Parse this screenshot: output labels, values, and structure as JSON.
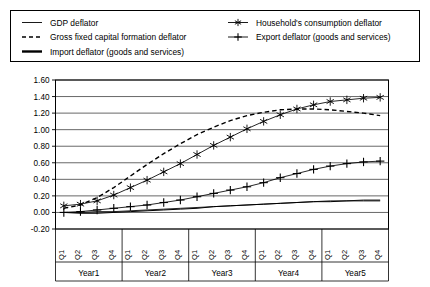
{
  "legend": {
    "position": "top",
    "items": [
      {
        "label": "GDP deflator",
        "marker": "line-thin",
        "key": "gdp"
      },
      {
        "label": "Household's consumption deflator",
        "marker": "line-star",
        "key": "household"
      },
      {
        "label": "Gross fixed capital formation deflator",
        "marker": "line-dashed",
        "key": "gfcf"
      },
      {
        "label": "Export deflator (goods and services)",
        "marker": "line-plus",
        "key": "export"
      },
      {
        "label": "Import deflator (goods and services)",
        "marker": "line-thick",
        "key": "import"
      }
    ]
  },
  "chart_data": {
    "type": "line",
    "title": "",
    "xlabel": "",
    "ylabel": "",
    "ylim": [
      -0.2,
      1.6
    ],
    "ytick_step": 0.2,
    "grid": true,
    "ytick_labels": [
      "1.60",
      "1.40",
      "1.20",
      "1.00",
      "0.80",
      "0.60",
      "0.40",
      "0.20",
      "0.00",
      "-0.20"
    ],
    "ytick_values": [
      1.6,
      1.4,
      1.2,
      1.0,
      0.8,
      0.6,
      0.4,
      0.2,
      0.0,
      -0.2
    ],
    "x": [
      "Q1",
      "Q2",
      "Q3",
      "Q4",
      "Q1",
      "Q2",
      "Q3",
      "Q4",
      "Q1",
      "Q2",
      "Q3",
      "Q4",
      "Q1",
      "Q2",
      "Q3",
      "Q4",
      "Q1",
      "Q2",
      "Q3",
      "Q4"
    ],
    "x_groups": [
      {
        "label": "Year1",
        "span": 4
      },
      {
        "label": "Year2",
        "span": 4
      },
      {
        "label": "Year3",
        "span": 4
      },
      {
        "label": "Year4",
        "span": 4
      },
      {
        "label": "Year5",
        "span": 4
      }
    ],
    "series": [
      {
        "name": "GDP deflator",
        "key": "gdp",
        "style": "solid-thin",
        "marker": "none",
        "values": [
          0.0,
          0.0,
          0.01,
          0.01,
          0.02,
          0.03,
          0.04,
          0.05,
          0.06,
          0.07,
          0.08,
          0.09,
          0.1,
          0.11,
          0.12,
          0.13,
          0.14,
          0.14,
          0.15,
          0.15
        ]
      },
      {
        "name": "Gross fixed capital formation deflator",
        "key": "gfcf",
        "style": "dashed",
        "marker": "none",
        "values": [
          0.05,
          0.09,
          0.18,
          0.3,
          0.44,
          0.58,
          0.71,
          0.83,
          0.94,
          1.03,
          1.11,
          1.17,
          1.21,
          1.24,
          1.25,
          1.25,
          1.24,
          1.22,
          1.2,
          1.17
        ]
      },
      {
        "name": "Import deflator (goods and services)",
        "key": "import",
        "style": "solid-thick",
        "marker": "none",
        "values": [
          0.0,
          -0.01,
          -0.01,
          0.0,
          0.01,
          0.02,
          0.03,
          0.04,
          0.05,
          0.07,
          0.08,
          0.09,
          0.1,
          0.11,
          0.12,
          0.13,
          0.13,
          0.14,
          0.14,
          0.14
        ]
      },
      {
        "name": "Household's consumption deflator",
        "key": "household",
        "style": "solid-thin",
        "marker": "star",
        "values": [
          0.08,
          0.1,
          0.14,
          0.21,
          0.3,
          0.39,
          0.49,
          0.59,
          0.7,
          0.81,
          0.91,
          1.01,
          1.1,
          1.18,
          1.25,
          1.3,
          1.34,
          1.36,
          1.38,
          1.39
        ]
      },
      {
        "name": "Export deflator (goods and services)",
        "key": "export",
        "style": "solid-thin",
        "marker": "plus",
        "values": [
          0.0,
          0.01,
          0.03,
          0.05,
          0.07,
          0.09,
          0.12,
          0.15,
          0.19,
          0.23,
          0.27,
          0.31,
          0.36,
          0.42,
          0.47,
          0.52,
          0.56,
          0.59,
          0.61,
          0.62
        ]
      }
    ]
  },
  "colors": {
    "line": "#000000",
    "background": "#ffffff",
    "frame": "#000000"
  }
}
